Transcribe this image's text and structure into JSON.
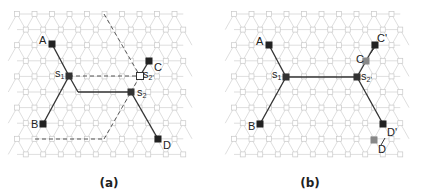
{
  "figure": {
    "panels": [
      {
        "id": "a",
        "caption": "(a)",
        "labels": {
          "A": "A",
          "B": "B",
          "C": "C",
          "D": "D",
          "s1": "s",
          "s1_sub": "1",
          "s2": "s",
          "s2_sub": "2",
          "s2p": "s",
          "s2p_sub": "2'"
        }
      },
      {
        "id": "b",
        "caption": "(b)",
        "labels": {
          "A": "A",
          "B": "B",
          "C": "C",
          "Cp": "C'",
          "D": "D",
          "Dp": "D'",
          "s1": "s",
          "s1_sub": "1",
          "s2p": "s",
          "s2p_sub": "2'"
        }
      }
    ],
    "colors": {
      "grid": "#c8c8c8",
      "edge": "#333333",
      "terminal": "#222222",
      "moved_terminal": "#888888"
    }
  }
}
